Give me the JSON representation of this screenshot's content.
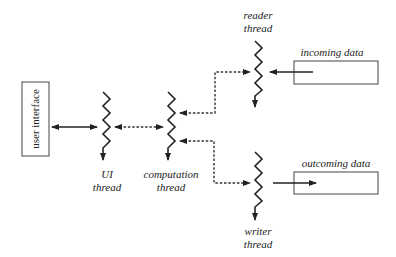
{
  "diagram": {
    "type": "thread-architecture",
    "nodes": {
      "user_interface": {
        "label": "user interface"
      },
      "ui_thread": {
        "label_line1": "UI",
        "label_line2": "thread"
      },
      "computation_thread": {
        "label_line1": "computation",
        "label_line2": "thread"
      },
      "reader_thread": {
        "label_line1": "reader",
        "label_line2": "thread"
      },
      "writer_thread": {
        "label_line1": "writer",
        "label_line2": "thread"
      },
      "incoming_data": {
        "label": "incoming data"
      },
      "outcoming_data": {
        "label": "outcoming data"
      }
    },
    "edges": [
      {
        "from": "user_interface",
        "to": "ui_thread",
        "style": "solid",
        "direction": "bidirectional"
      },
      {
        "from": "ui_thread",
        "to": "computation_thread",
        "style": "dashed",
        "direction": "bidirectional"
      },
      {
        "from": "computation_thread",
        "to": "reader_thread",
        "style": "dashed",
        "direction": "bidirectional"
      },
      {
        "from": "computation_thread",
        "to": "writer_thread",
        "style": "dashed",
        "direction": "bidirectional"
      },
      {
        "from": "incoming_data",
        "to": "reader_thread",
        "style": "solid",
        "direction": "forward"
      },
      {
        "from": "writer_thread",
        "to": "outcoming_data",
        "style": "solid",
        "direction": "forward"
      }
    ],
    "colors": {
      "line": "#222222",
      "background": "#ffffff"
    }
  }
}
